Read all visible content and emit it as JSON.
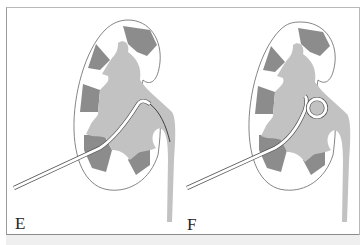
{
  "figure": {
    "panels": [
      {
        "label": "E",
        "description": "Kidney with catheter inserted percutaneously; guidewire tip advanced into upper ureter"
      },
      {
        "label": "F",
        "description": "Kidney with pigtail nephrostomy catheter coiled in renal pelvis"
      }
    ],
    "colors": {
      "cortex": "#ffffff",
      "medulla_pyramids": "#8c8c8c",
      "collecting_system": "#c2c2c2",
      "outline": "#555555",
      "catheter": "#ffffff"
    }
  }
}
